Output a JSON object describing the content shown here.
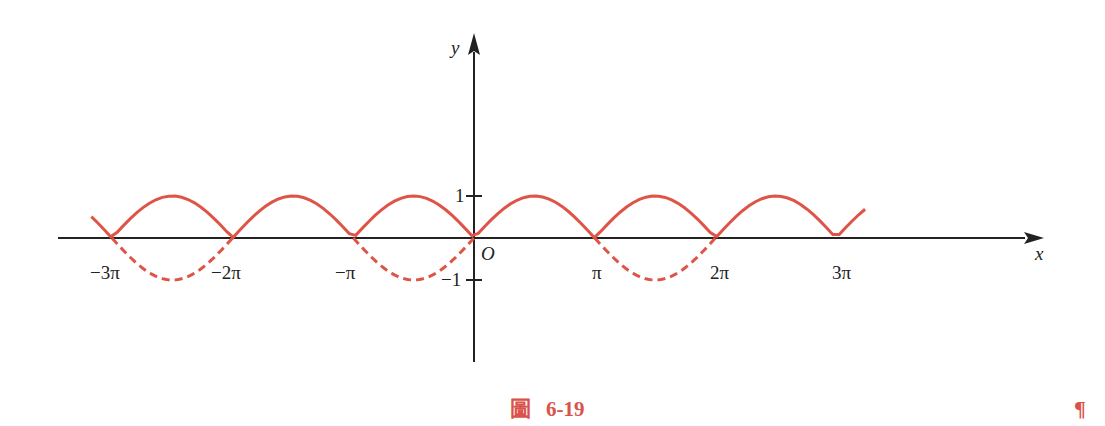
{
  "figure": {
    "caption_prefix": "圖",
    "caption_number": "6-19",
    "paragraph_mark": "¶"
  },
  "colors": {
    "curve": "#de5548",
    "axis": "#222222",
    "caption": "#d9534a"
  },
  "axes": {
    "x_label": "x",
    "y_label": "y",
    "origin_label": "O",
    "x_tick_labels": [
      "−3π",
      "−2π",
      "−π",
      "π",
      "2π",
      "3π"
    ],
    "y_tick_labels": [
      "1",
      "−1"
    ]
  },
  "chart_data": {
    "type": "line",
    "title": "圖 6-19",
    "xlabel": "x",
    "ylabel": "y",
    "xlim": [
      -3.2,
      3.2
    ],
    "ylim": [
      -1.5,
      4.8
    ],
    "x_unit": "π",
    "series": [
      {
        "name": "y = |sin x| (solid)",
        "style": "solid",
        "function": "|sin x|",
        "domain": [
          -3.17,
          3.24
        ],
        "zeros": [
          "-3π",
          "-2π",
          "-π",
          "0",
          "π",
          "2π",
          "3π"
        ],
        "maxima": [
          {
            "x": "-5π/2",
            "y": 1
          },
          {
            "x": "-3π/2",
            "y": 1
          },
          {
            "x": "-π/2",
            "y": 1
          },
          {
            "x": "π/2",
            "y": 1
          },
          {
            "x": "3π/2",
            "y": 1
          },
          {
            "x": "5π/2",
            "y": 1
          }
        ]
      },
      {
        "name": "y = sin x negative portions (dashed)",
        "style": "dashed",
        "function": "sin x",
        "intervals": [
          [
            "-3π",
            "-2π"
          ],
          [
            "-π",
            "0"
          ],
          [
            "π",
            "2π"
          ]
        ],
        "minima": [
          {
            "x": "-5π/2",
            "y": -1
          },
          {
            "x": "-π/2",
            "y": -1
          },
          {
            "x": "3π/2",
            "y": -1
          }
        ]
      }
    ],
    "x_ticks": [
      "-3π",
      "-2π",
      "-π",
      "O",
      "π",
      "2π",
      "3π"
    ],
    "y_ticks": [
      1,
      -1
    ],
    "grid": false,
    "legend": "none"
  }
}
